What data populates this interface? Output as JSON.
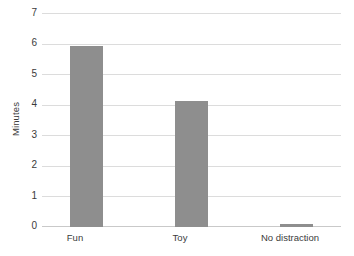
{
  "chart_data": {
    "type": "bar",
    "title": "",
    "subtitle": "",
    "xlabel": "",
    "ylabel": "Minutes",
    "categories": [
      "Fun",
      "Toy",
      "No distraction"
    ],
    "values": [
      5.95,
      4.15,
      0.1
    ],
    "series": [
      {
        "name": "Minutes",
        "values": [
          5.95,
          4.15,
          0.1
        ]
      }
    ],
    "ylim": [
      0,
      7
    ],
    "ytick_labels": [
      "0",
      "1",
      "2",
      "3",
      "4",
      "5",
      "6",
      "7"
    ],
    "ytick_values": [
      0,
      1,
      2,
      3,
      4,
      5,
      6,
      7
    ],
    "grid": true,
    "grid_axis": "y",
    "legend": false,
    "legend_position": "none",
    "annotations": [],
    "colors": {
      "bar": "#8e8e8e",
      "gridline": "#dcdcdc",
      "axis": "#c9c9c9",
      "text": "#3b3b3b",
      "background": "#ffffff"
    }
  }
}
